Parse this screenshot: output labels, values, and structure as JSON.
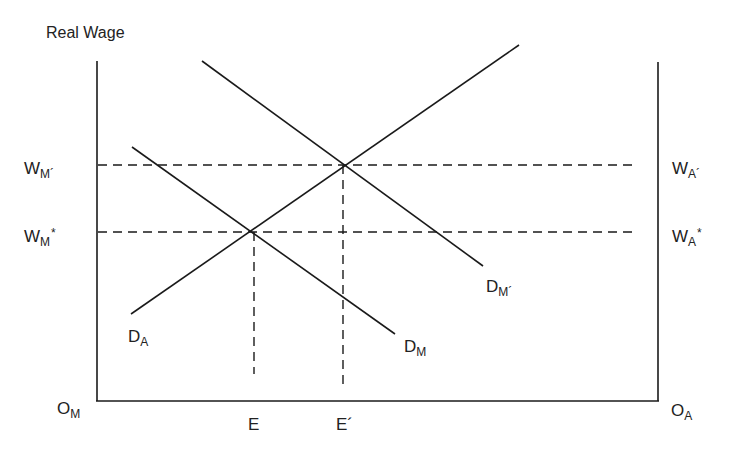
{
  "diagram": {
    "y_axis_title": "Real Wage",
    "origin_left": {
      "main": "O",
      "sub": "M"
    },
    "origin_right": {
      "main": "O",
      "sub": "A"
    },
    "wage_labels_left": [
      {
        "main": "W",
        "sub": "M´",
        "sup": ""
      },
      {
        "main": "W",
        "sub": "M",
        "sup": "*"
      }
    ],
    "wage_labels_right": [
      {
        "main": "W",
        "sub": "A´",
        "sup": ""
      },
      {
        "main": "W",
        "sub": "A",
        "sup": "*"
      }
    ],
    "x_labels": [
      "E",
      "E´"
    ],
    "curves": [
      {
        "id": "D_A",
        "main": "D",
        "sub": "A",
        "from": [
          131,
          314
        ],
        "to": [
          519,
          45
        ]
      },
      {
        "id": "D_M",
        "main": "D",
        "sub": "M",
        "from": [
          132,
          147
        ],
        "to": [
          395,
          334
        ]
      },
      {
        "id": "D_M_prime",
        "main": "D",
        "sub": "M´",
        "from": [
          202,
          61
        ],
        "to": [
          483,
          266
        ]
      }
    ],
    "equilibria": [
      {
        "name": "initial",
        "x": 254,
        "y": 232,
        "wage": "W_M* / W_A*",
        "employment": "E"
      },
      {
        "name": "new",
        "x": 344,
        "y": 165,
        "wage": "W_M´ / W_A´",
        "employment": "E´"
      }
    ],
    "colors": {
      "line": "#1a1a1a",
      "text": "#222222",
      "background": "#ffffff"
    }
  }
}
